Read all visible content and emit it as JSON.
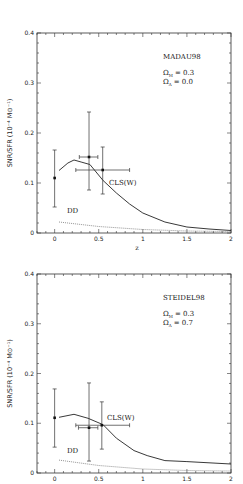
{
  "figure": {
    "ylabel": "SNR/SFR (10⁻⁴ M⊙⁻¹)",
    "xlabel": "z"
  },
  "chart_data": [
    {
      "type": "line",
      "title": "MADAU98",
      "annotations": [
        "MADAU98",
        "ΩM = 0.3",
        "ΩΛ = 0.0",
        "CLS(W)",
        "DD"
      ],
      "omega_m": "0.3",
      "omega_lambda": "0.0",
      "xlabel": "z",
      "ylabel": "SNR/SFR (10^-4 M_sun^-1)",
      "xlim": [
        -0.2,
        2
      ],
      "ylim": [
        0,
        0.4
      ],
      "xticks": [
        "0",
        "0.5",
        "1",
        "1.5",
        "2"
      ],
      "yticks": [
        "0",
        "0.1",
        "0.2",
        "0.3",
        "0.4"
      ],
      "grid": false,
      "series": [
        {
          "name": "CLS(W)",
          "style": "solid",
          "x": [
            0.05,
            0.15,
            0.22,
            0.3,
            0.4,
            0.55,
            0.7,
            0.85,
            1.0,
            1.25,
            1.5,
            1.75,
            2.0
          ],
          "y": [
            0.125,
            0.14,
            0.146,
            0.142,
            0.137,
            0.105,
            0.08,
            0.058,
            0.04,
            0.022,
            0.012,
            0.008,
            0.005
          ]
        },
        {
          "name": "DD",
          "style": "dotted",
          "x": [
            0.05,
            0.5,
            1.0,
            1.5,
            2.0
          ],
          "y": [
            0.022,
            0.013,
            0.007,
            0.004,
            0.003
          ]
        }
      ],
      "points": [
        {
          "x": 0.0,
          "y": 0.11,
          "yerr_low": 0.052,
          "yerr_high": 0.166,
          "xerr_low": 0.0,
          "xerr_high": 0.0
        },
        {
          "x": 0.39,
          "y": 0.152,
          "yerr_low": 0.086,
          "yerr_high": 0.242,
          "xerr_low": 0.28,
          "xerr_high": 0.49
        },
        {
          "x": 0.545,
          "y": 0.126,
          "yerr_low": 0.078,
          "yerr_high": 0.172,
          "xerr_low": 0.24,
          "xerr_high": 0.85
        }
      ]
    },
    {
      "type": "line",
      "title": "STEIDEL98",
      "annotations": [
        "STEIDEL98",
        "ΩM = 0.3",
        "ΩΛ = 0.7",
        "CLS(W)",
        "DD"
      ],
      "omega_m": "0.3",
      "omega_lambda": "0.7",
      "xlabel": "",
      "ylabel": "SNR/SFR (10^-4 M_sun^-1)",
      "xlim": [
        -0.2,
        2
      ],
      "ylim": [
        0,
        0.4
      ],
      "xticks": [
        "0",
        "0.5",
        "1",
        "1.5",
        "2"
      ],
      "yticks": [
        "0",
        "0.1",
        "0.2",
        "0.3",
        "0.4"
      ],
      "grid": false,
      "series": [
        {
          "name": "CLS(W)",
          "style": "solid",
          "x": [
            0.05,
            0.22,
            0.38,
            0.55,
            0.7,
            0.9,
            1.05,
            1.25,
            1.5,
            2.0
          ],
          "y": [
            0.112,
            0.118,
            0.11,
            0.097,
            0.07,
            0.045,
            0.035,
            0.025,
            0.023,
            0.018
          ]
        },
        {
          "name": "DD",
          "style": "dotted",
          "x": [
            0.05,
            0.5,
            1.0,
            1.5,
            2.0
          ],
          "y": [
            0.026,
            0.015,
            0.008,
            0.005,
            0.004
          ]
        }
      ],
      "points": [
        {
          "x": 0.0,
          "y": 0.111,
          "yerr_low": 0.052,
          "yerr_high": 0.169,
          "xerr_low": 0.0,
          "xerr_high": 0.0
        },
        {
          "x": 0.39,
          "y": 0.091,
          "yerr_low": 0.024,
          "yerr_high": 0.181,
          "xerr_low": 0.27,
          "xerr_high": 0.49
        },
        {
          "x": 0.535,
          "y": 0.096,
          "yerr_low": 0.048,
          "yerr_high": 0.143,
          "xerr_low": 0.24,
          "xerr_high": 0.85
        }
      ]
    }
  ],
  "panels": [
    {
      "model_label": "MADAU98",
      "omega_m_label": "Ω",
      "omega_m_sub": "M",
      "omega_m_value": "= 0.3",
      "omega_l_label": "Ω",
      "omega_l_sub": "Λ",
      "omega_l_value": "= 0.0",
      "curve_label": "CLS(W)",
      "dd_label": "DD",
      "xlabel": "z"
    },
    {
      "model_label": "STEIDEL98",
      "omega_m_label": "Ω",
      "omega_m_sub": "M",
      "omega_m_value": "= 0.3",
      "omega_l_label": "Ω",
      "omega_l_sub": "Λ",
      "omega_l_value": "= 0.7",
      "curve_label": "CLS(W)",
      "dd_label": "DD",
      "xlabel": ""
    }
  ]
}
